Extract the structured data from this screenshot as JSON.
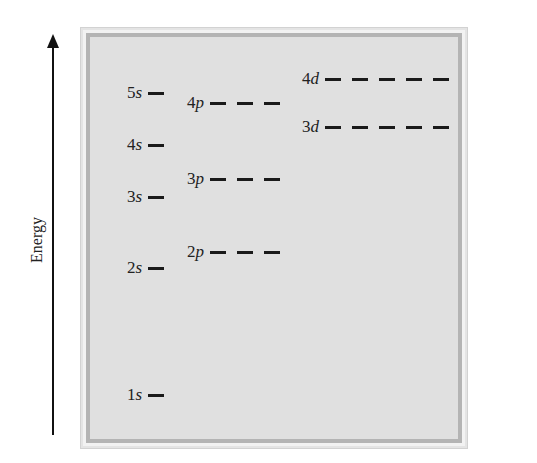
{
  "axis": {
    "label": "Energy"
  },
  "levels": [
    {
      "id": "1s",
      "n": "1",
      "l": "s",
      "orbitals": 1,
      "x": 127,
      "y": 395
    },
    {
      "id": "2s",
      "n": "2",
      "l": "s",
      "orbitals": 1,
      "x": 127,
      "y": 268
    },
    {
      "id": "2p",
      "n": "2",
      "l": "p",
      "orbitals": 3,
      "x": 187,
      "y": 252
    },
    {
      "id": "3s",
      "n": "3",
      "l": "s",
      "orbitals": 1,
      "x": 127,
      "y": 197
    },
    {
      "id": "3p",
      "n": "3",
      "l": "p",
      "orbitals": 3,
      "x": 187,
      "y": 179
    },
    {
      "id": "4s",
      "n": "4",
      "l": "s",
      "orbitals": 1,
      "x": 127,
      "y": 145
    },
    {
      "id": "3d",
      "n": "3",
      "l": "d",
      "orbitals": 5,
      "x": 302,
      "y": 127
    },
    {
      "id": "4p",
      "n": "4",
      "l": "p",
      "orbitals": 3,
      "x": 187,
      "y": 103
    },
    {
      "id": "5s",
      "n": "5",
      "l": "s",
      "orbitals": 1,
      "x": 127,
      "y": 93
    },
    {
      "id": "4d",
      "n": "4",
      "l": "d",
      "orbitals": 5,
      "x": 302,
      "y": 79
    }
  ],
  "colors": {
    "panel": "#e0e0e0",
    "frame_dark": "#b4b4b4",
    "ink": "#1a1a1a"
  }
}
